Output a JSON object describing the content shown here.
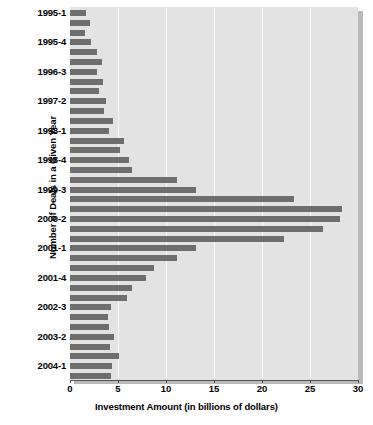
{
  "chart_data": {
    "type": "bar",
    "orientation": "horizontal",
    "title": "",
    "xlabel": "Investment Amount (in billions of dollars)",
    "ylabel": "Number of Deals in a Given Year",
    "xlim": [
      0,
      30
    ],
    "xticks": [
      0,
      5,
      10,
      15,
      20,
      25,
      30
    ],
    "xticklabels": [
      "0",
      "5",
      "10",
      "15",
      "20",
      "25",
      "30"
    ],
    "grid": true,
    "grid_axis": "x",
    "legend": false,
    "bar_color": "#6e6e6e",
    "plot_background": "#e3e3e3",
    "categories": [
      "1995-1",
      "1995-2",
      "1995-3",
      "1995-4",
      "1996-1",
      "1996-2",
      "1996-3",
      "1996-4",
      "1997-1",
      "1997-2",
      "1997-3",
      "1997-4",
      "1998-1",
      "1998-2",
      "1998-3",
      "1998-4",
      "1999-1",
      "1999-2",
      "1999-3",
      "1999-4",
      "2000-1",
      "2000-2",
      "2000-3",
      "2000-4",
      "2001-1",
      "2001-2",
      "2001-3",
      "2001-4",
      "2002-1",
      "2002-2",
      "2002-3",
      "2002-4",
      "2003-1",
      "2003-2",
      "2003-3",
      "2003-4",
      "2004-1",
      "2004-2"
    ],
    "values": [
      1.7,
      2.1,
      1.6,
      2.2,
      2.8,
      3.3,
      2.8,
      3.4,
      3.0,
      3.7,
      3.5,
      4.5,
      4.1,
      5.6,
      5.2,
      6.1,
      6.5,
      11.1,
      13.1,
      23.3,
      28.3,
      28.1,
      26.4,
      22.3,
      13.1,
      11.1,
      8.7,
      7.9,
      6.5,
      5.9,
      4.3,
      4.0,
      4.1,
      4.6,
      4.2,
      5.1,
      4.4,
      4.3
    ],
    "visible_ytick_labels": [
      "1995-1",
      "1995-4",
      "1996-3",
      "1997-2",
      "1998-1",
      "1998-4",
      "1999-3",
      "2000-2",
      "2001-1",
      "2001-4",
      "2002-3",
      "2003-2",
      "2004-1"
    ],
    "ytick_label_indices": [
      0,
      3,
      6,
      9,
      12,
      15,
      18,
      21,
      24,
      27,
      30,
      33,
      36
    ]
  }
}
